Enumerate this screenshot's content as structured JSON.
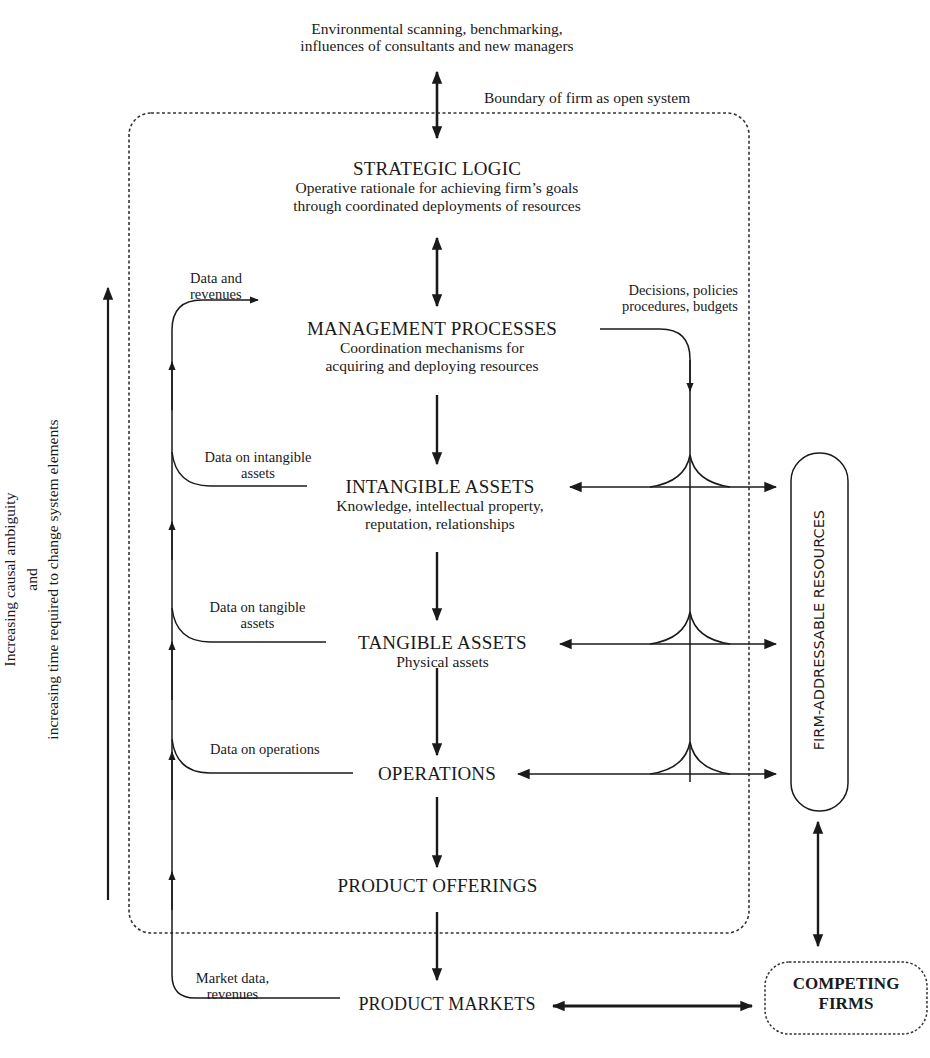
{
  "diagram": {
    "external_influences": {
      "line1": "Environmental scanning, benchmarking,",
      "line2": "influences of consultants and new managers"
    },
    "boundary_label": "Boundary of firm as open system",
    "nodes": {
      "strategic_logic": {
        "title": "STRATEGIC LOGIC",
        "desc_line1": "Operative rationale for achieving firm’s goals",
        "desc_line2": "through coordinated  deployments of resources"
      },
      "management_processes": {
        "title": "MANAGEMENT PROCESSES",
        "desc_line1": "Coordination mechanisms for",
        "desc_line2": "acquiring and deploying resources"
      },
      "intangible_assets": {
        "title": "INTANGIBLE ASSETS",
        "desc_line1": "Knowledge, intellectual property,",
        "desc_line2": "reputation, relationships"
      },
      "tangible_assets": {
        "title": "TANGIBLE ASSETS",
        "desc_line1": "Physical assets"
      },
      "operations": {
        "title": "OPERATIONS"
      },
      "product_offerings": {
        "title": "PRODUCT OFFERINGS"
      },
      "product_markets": {
        "title": "PRODUCT MARKETS"
      },
      "firm_addressable_resources": {
        "title": "FIRM-ADDRESSABLE RESOURCES"
      },
      "competing_firms": {
        "line1": "COMPETING",
        "line2": "FIRMS"
      }
    },
    "feedback_labels": {
      "data_and_revenues": {
        "line1": "Data and",
        "line2": "revenues"
      },
      "data_on_intangible": {
        "line1": "Data on intangible",
        "line2": "assets"
      },
      "data_on_tangible": {
        "line1": "Data on tangible",
        "line2": "assets"
      },
      "data_on_operations": {
        "line1": "Data on operations"
      },
      "market_data": {
        "line1": "Market data,",
        "line2": "revenues"
      }
    },
    "decisions_label": {
      "line1": "Decisions, policies",
      "line2": "procedures, budgets"
    },
    "side_axis": {
      "line1": "Increasing causal ambiguity",
      "line2": "and",
      "line3": "increasing time required to change system elements"
    },
    "colors": {
      "ink": "#1a1a1a",
      "boundary": "#333333",
      "background": "#ffffff"
    }
  }
}
